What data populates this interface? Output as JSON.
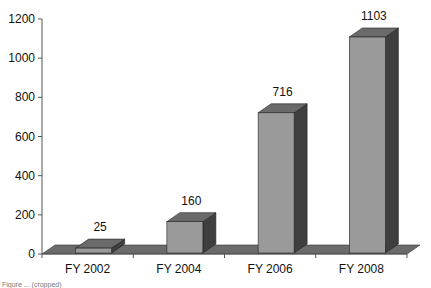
{
  "chart_data": {
    "type": "bar",
    "style": "3d-column",
    "title": "",
    "xlabel": "",
    "ylabel": "",
    "categories": [
      "FY 2002",
      "FY 2004",
      "FY 2006",
      "FY 2008"
    ],
    "values": [
      25,
      160,
      716,
      1103
    ],
    "data_labels": [
      "25",
      "160",
      "716",
      "1103"
    ],
    "ylim": [
      0,
      1200
    ],
    "yticks": [
      "0",
      "200",
      "400",
      "600",
      "800",
      "1000",
      "1200"
    ],
    "grid": false,
    "legend": null,
    "colors": {
      "front": "#9a9a9a",
      "top": "#6a6a6a",
      "side": "#3f3f3f",
      "floor": "#6b6b6b"
    }
  },
  "caption": "Figure ... (cropped)"
}
